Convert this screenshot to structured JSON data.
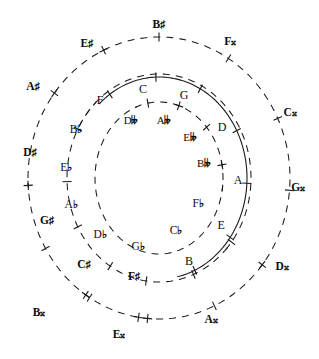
{
  "figure": {
    "center": {
      "x": 159,
      "y": 178
    },
    "ink_color": "#1a1a1a",
    "background": "#ffffff"
  },
  "rings": [
    {
      "id": "outer-sharps-ring",
      "style": "dashed",
      "radius_x": 131,
      "radius_y": 141,
      "description": "outermost dashed ring of sharps and double sharps"
    },
    {
      "id": "natural-ring",
      "style": "solid",
      "radius_x": 88,
      "radius_y": 101,
      "description": "solid ring of natural notes"
    },
    {
      "id": "flats-ring",
      "style": "dashed",
      "radius_x": 92,
      "radius_y": 104,
      "description": "dashed ring of flat notes"
    },
    {
      "id": "double-flats-ring",
      "style": "dashed",
      "radius_x": 64,
      "radius_y": 76,
      "description": "innermost dashed ring of double flats"
    }
  ],
  "labels": {
    "outer_ring": [
      {
        "text": "B",
        "accidental": "♯",
        "name": "b-sharp",
        "x": 159,
        "y": 25,
        "tick": "bar",
        "angle": -90
      },
      {
        "text": "F",
        "accidental": "𝄪",
        "name": "f-double-sharp",
        "x": 230,
        "y": 42,
        "tick": "bar",
        "angle": -58
      },
      {
        "text": "C",
        "accidental": "𝄪",
        "name": "c-double-sharp",
        "x": 290,
        "y": 113,
        "tick": "bar",
        "angle": -25
      },
      {
        "text": "G",
        "accidental": "𝄪",
        "name": "g-double-sharp",
        "x": 298,
        "y": 188,
        "tick": "bar",
        "angle": 5
      },
      {
        "text": "D",
        "accidental": "𝄪",
        "name": "d-double-sharp",
        "x": 282,
        "y": 267,
        "tick": "cross",
        "angle": 38
      },
      {
        "text": "A",
        "accidental": "𝄪",
        "name": "a-double-sharp",
        "x": 211,
        "y": 320,
        "tick": "bar",
        "angle": 65
      },
      {
        "text": "E",
        "accidental": "𝄪",
        "name": "e-double-sharp",
        "x": 119,
        "y": 335,
        "tick": "plus",
        "angle": 95
      },
      {
        "text": "B",
        "accidental": "𝄪",
        "name": "b-double-sharp",
        "x": 39,
        "y": 313,
        "tick": "cross",
        "angle": 124
      },
      {
        "text": "A",
        "accidental": "♯",
        "name": "a-sharp",
        "x": 33,
        "y": 87,
        "tick": "cross",
        "angle": -143
      },
      {
        "text": "E",
        "accidental": "♯",
        "name": "e-sharp",
        "x": 87,
        "y": 44,
        "tick": "cross",
        "angle": -115
      },
      {
        "text": "D",
        "accidental": "♯",
        "name": "d-sharp",
        "x": 30,
        "y": 153,
        "tick": "plus",
        "angle": 177
      },
      {
        "text": "G",
        "accidental": "♯",
        "name": "g-sharp",
        "x": 47,
        "y": 221,
        "tick": "bar",
        "angle": 150
      },
      {
        "text": "C",
        "accidental": "♯",
        "name": "c-sharp",
        "x": 84,
        "y": 265,
        "tick": "bar",
        "angle": 122
      },
      {
        "text": "F",
        "accidental": "♯",
        "name": "f-sharp",
        "x": 134,
        "y": 277,
        "tick": "plus",
        "angle": 99
      }
    ],
    "natural_ring": [
      {
        "text": "C",
        "accidental": "",
        "name": "c-natural",
        "x": 143,
        "y": 89,
        "tick": "bar",
        "angle": -92
      },
      {
        "text": "G",
        "accidental": "",
        "name": "g-natural",
        "x": 184,
        "y": 95,
        "tick": "bar",
        "angle": -62
      },
      {
        "text": "D",
        "accidental": "",
        "name": "d-natural",
        "x": 222,
        "y": 127,
        "tick": "bar",
        "angle": -28
      },
      {
        "text": "A",
        "accidental": "",
        "name": "a-natural",
        "x": 238,
        "y": 180,
        "tick": "bar",
        "angle": 3
      },
      {
        "text": "E",
        "accidental": "",
        "name": "e-natural",
        "x": 221,
        "y": 225,
        "tick": "bar",
        "angle": 36
      },
      {
        "text": "B",
        "accidental": "",
        "name": "b-natural",
        "x": 189,
        "y": 261,
        "tick": "bar",
        "angle": 66
      },
      {
        "text": "F",
        "accidental": "",
        "name": "f-natural",
        "x": 100,
        "y": 100,
        "tick": "bar",
        "angle": -124
      }
    ],
    "flats_ring": [
      {
        "text": "B",
        "accidental": "♭",
        "name": "b-flat",
        "x": 76,
        "y": 130,
        "tick": "bar",
        "angle": -152
      },
      {
        "text": "E",
        "accidental": "♭",
        "name": "e-flat",
        "x": 66,
        "y": 168,
        "tick": "bar",
        "angle": 178
      },
      {
        "text": "A",
        "accidental": "♭",
        "name": "a-flat",
        "x": 71,
        "y": 205,
        "tick": "bar",
        "angle": 152
      },
      {
        "text": "D",
        "accidental": "♭",
        "name": "d-flat",
        "x": 100,
        "y": 235,
        "tick": "bar",
        "angle": 122
      },
      {
        "text": "G",
        "accidental": "♭",
        "name": "g-flat",
        "x": 138,
        "y": 247,
        "tick": "bar",
        "angle": 98
      },
      {
        "text": "C",
        "accidental": "♭",
        "name": "c-flat",
        "x": 176,
        "y": 231,
        "tick": "bar",
        "angle": 68
      },
      {
        "text": "F",
        "accidental": "♭",
        "name": "f-flat",
        "x": 198,
        "y": 204,
        "tick": "bar",
        "angle": 38
      }
    ],
    "double_flats_ring": [
      {
        "text": "D",
        "accidental": "𝄫",
        "name": "d-double-flat",
        "x": 131,
        "y": 120,
        "tick": "bar",
        "angle": -100
      },
      {
        "text": "A",
        "accidental": "𝄫",
        "name": "a-double-flat",
        "x": 164,
        "y": 120,
        "tick": "cross",
        "angle": -72
      },
      {
        "text": "E",
        "accidental": "𝄫",
        "name": "e-double-flat",
        "x": 190,
        "y": 137,
        "tick": "bar",
        "angle": -42
      },
      {
        "text": "B",
        "accidental": "𝄫",
        "name": "b-double-flat",
        "x": 204,
        "y": 163,
        "tick": "plus",
        "angle": -10
      }
    ]
  }
}
